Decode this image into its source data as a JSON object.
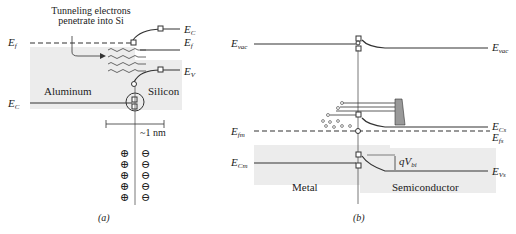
{
  "panel_a": {
    "caption": "(a)",
    "annotation": [
      "Tunneling electrons",
      "penetrate into Si"
    ],
    "left_material": "Aluminum",
    "right_material": "Silicon",
    "width_label": "~1 nm",
    "levels": {
      "ef_left": {
        "main": "E",
        "sub": "f"
      },
      "ec_left": {
        "main": "E",
        "sub": "C"
      },
      "ec_right": {
        "main": "E",
        "sub": "C"
      },
      "ef_right": {
        "main": "E",
        "sub": "f"
      },
      "ev_right": {
        "main": "E",
        "sub": "V"
      }
    },
    "charges": {
      "left": [
        "⊕",
        "⊕",
        "⊕",
        "⊕",
        "⊕"
      ],
      "right": [
        "⊖",
        "⊖",
        "⊖",
        "⊖",
        "⊖"
      ]
    }
  },
  "panel_b": {
    "caption": "(b)",
    "left_material": "Metal",
    "right_material": "Semiconductor",
    "barrier_label": {
      "main": "qV",
      "sub": "bi"
    },
    "levels": {
      "evac_left": {
        "main": "E",
        "sub": "vac"
      },
      "evac_right": {
        "main": "E",
        "sub": "vac"
      },
      "efm": {
        "main": "E",
        "sub": "fm"
      },
      "ecm": {
        "main": "E",
        "sub": "Cm"
      },
      "ecs": {
        "main": "E",
        "sub": "Cs"
      },
      "efs": {
        "main": "E",
        "sub": "fs"
      },
      "evs": {
        "main": "E",
        "sub": "Vs"
      }
    }
  }
}
